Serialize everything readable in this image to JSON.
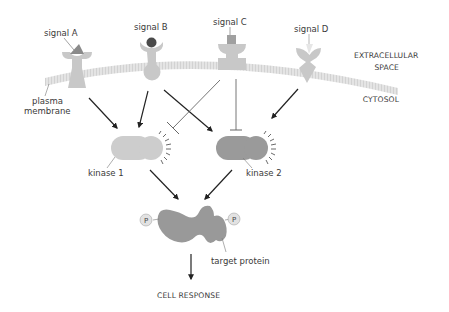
{
  "diagram": {
    "signals": [
      {
        "label": "signal A"
      },
      {
        "label": "signal B"
      },
      {
        "label": "signal C"
      },
      {
        "label": "signal D"
      }
    ],
    "membrane": {
      "label_line1": "plasma",
      "label_line2": "membrane"
    },
    "regions": {
      "extracellular_line1": "EXTRACELLULAR",
      "extracellular_line2": "SPACE",
      "cytosol": "CYTOSOL"
    },
    "kinases": [
      {
        "label": "kinase 1",
        "color": "#cdcdcd"
      },
      {
        "label": "kinase 2",
        "color": "#9a9a9a"
      }
    ],
    "target": {
      "label": "target protein",
      "color": "#999999",
      "phosphate_label": "P"
    },
    "output": {
      "label": "CELL RESPONSE"
    },
    "colors": {
      "receptor": "#c8c8c8",
      "membrane": "#e2e2e2",
      "signal_a": "#8a8a8a",
      "signal_b": "#4a4a4a",
      "signal_c": "#a0a0a0",
      "signal_d": "#e6e6e6",
      "arrow": "#222222",
      "inhibit_line": "#666666"
    }
  }
}
